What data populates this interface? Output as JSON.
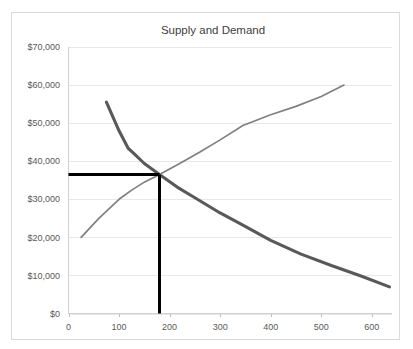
{
  "chart_data": {
    "type": "line",
    "title": "Supply and Demand",
    "xlabel": "",
    "ylabel": "",
    "xlim": [
      0,
      640
    ],
    "ylim": [
      0,
      70000
    ],
    "grid": true,
    "legend": "none",
    "x_ticks": [
      0,
      100,
      200,
      300,
      400,
      500,
      600
    ],
    "x_tick_labels": [
      "0",
      "100",
      "200",
      "300",
      "400",
      "500",
      "600"
    ],
    "y_ticks": [
      0,
      10000,
      20000,
      30000,
      40000,
      50000,
      60000,
      70000
    ],
    "y_tick_labels": [
      "$0",
      "$10,000",
      "$20,000",
      "$30,000",
      "$40,000",
      "$50,000",
      "$60,000",
      "$70,000"
    ],
    "series": [
      {
        "name": "Demand",
        "color": "#595959",
        "width": 3.1,
        "points": [
          [
            75,
            55500
          ],
          [
            100,
            48000
          ],
          [
            118,
            43400
          ],
          [
            128,
            42200
          ],
          [
            150,
            39400
          ],
          [
            180,
            36500
          ],
          [
            215,
            33200
          ],
          [
            250,
            30400
          ],
          [
            300,
            26400
          ],
          [
            345,
            23200
          ],
          [
            400,
            19200
          ],
          [
            460,
            15600
          ],
          [
            520,
            12600
          ],
          [
            580,
            9800
          ],
          [
            635,
            7000
          ]
        ]
      },
      {
        "name": "Supply",
        "color": "#808080",
        "width": 1.7,
        "points": [
          [
            25,
            20000
          ],
          [
            60,
            25000
          ],
          [
            100,
            30000
          ],
          [
            125,
            32400
          ],
          [
            150,
            34500
          ],
          [
            180,
            36500
          ],
          [
            220,
            39400
          ],
          [
            260,
            42400
          ],
          [
            300,
            45600
          ],
          [
            345,
            49400
          ],
          [
            400,
            52200
          ],
          [
            450,
            54400
          ],
          [
            500,
            57000
          ],
          [
            545,
            60000
          ]
        ]
      }
    ],
    "annotations": [
      {
        "name": "equilibrium-price-line",
        "type": "horizontal-rule",
        "color": "#000000",
        "y": 36500,
        "x_start": 0,
        "x_end": 180
      },
      {
        "name": "equilibrium-quantity-line",
        "type": "vertical-rule",
        "color": "#000000",
        "x": 180,
        "y_start": 0,
        "y_end": 36500
      }
    ],
    "equilibrium": {
      "quantity": 180,
      "price": 36500
    },
    "colors": {
      "demand": "#595959",
      "supply": "#808080",
      "equilibrium": "#000000",
      "gridline": "#e8e8e8",
      "axis": "#d0d0d0",
      "text": "#595959",
      "title_text": "#404040",
      "border": "#d9d9d9",
      "background": "#ffffff"
    }
  }
}
